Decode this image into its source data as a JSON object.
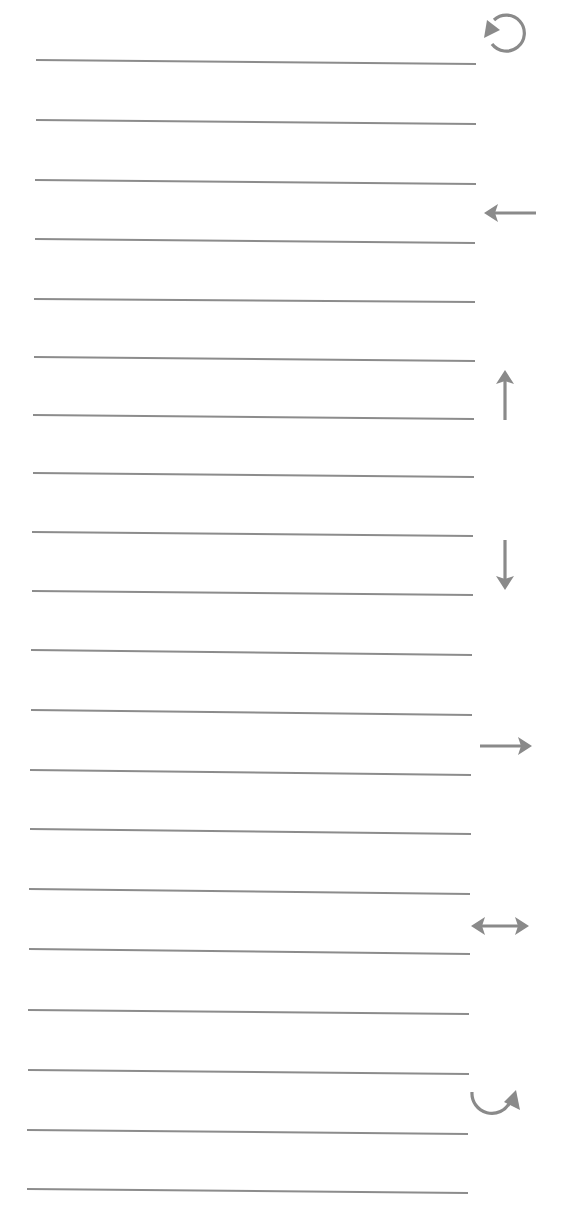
{
  "page": {
    "background": "#ffffff"
  },
  "style": {
    "line_color": "#8c8c8c",
    "icon_color": "#8a8a8a",
    "line_thickness": 2,
    "icon_stroke": 3.2
  },
  "lines": [
    {
      "x1": 36,
      "y1": 60,
      "x2": 476,
      "y2": 64
    },
    {
      "x1": 36,
      "y1": 120,
      "x2": 476,
      "y2": 124
    },
    {
      "x1": 35,
      "y1": 180,
      "x2": 476,
      "y2": 184
    },
    {
      "x1": 35,
      "y1": 239,
      "x2": 475,
      "y2": 243
    },
    {
      "x1": 34,
      "y1": 299,
      "x2": 475,
      "y2": 302
    },
    {
      "x1": 34,
      "y1": 357,
      "x2": 475,
      "y2": 361
    },
    {
      "x1": 33,
      "y1": 415,
      "x2": 474,
      "y2": 419
    },
    {
      "x1": 33,
      "y1": 473,
      "x2": 474,
      "y2": 477
    },
    {
      "x1": 32,
      "y1": 532,
      "x2": 473,
      "y2": 536
    },
    {
      "x1": 32,
      "y1": 591,
      "x2": 473,
      "y2": 595
    },
    {
      "x1": 31,
      "y1": 650,
      "x2": 472,
      "y2": 655
    },
    {
      "x1": 31,
      "y1": 710,
      "x2": 472,
      "y2": 715
    },
    {
      "x1": 30,
      "y1": 770,
      "x2": 471,
      "y2": 775
    },
    {
      "x1": 30,
      "y1": 829,
      "x2": 471,
      "y2": 834
    },
    {
      "x1": 29,
      "y1": 889,
      "x2": 470,
      "y2": 894
    },
    {
      "x1": 29,
      "y1": 949,
      "x2": 470,
      "y2": 954
    },
    {
      "x1": 28,
      "y1": 1010,
      "x2": 469,
      "y2": 1014
    },
    {
      "x1": 28,
      "y1": 1070,
      "x2": 469,
      "y2": 1074
    },
    {
      "x1": 27,
      "y1": 1130,
      "x2": 468,
      "y2": 1134
    },
    {
      "x1": 27,
      "y1": 1189,
      "x2": 468,
      "y2": 1193
    }
  ],
  "icons": [
    {
      "name": "rotate-counterclockwise-icon",
      "label": "Rotate counterclockwise",
      "x": 480,
      "y": 8,
      "w": 54,
      "h": 52
    },
    {
      "name": "arrow-left-icon",
      "label": "Arrow left",
      "x": 482,
      "y": 200,
      "w": 56,
      "h": 26
    },
    {
      "name": "arrow-up-icon",
      "label": "Arrow up",
      "x": 492,
      "y": 368,
      "w": 26,
      "h": 54
    },
    {
      "name": "arrow-down-icon",
      "label": "Arrow down",
      "x": 492,
      "y": 538,
      "w": 26,
      "h": 54
    },
    {
      "name": "arrow-right-icon",
      "label": "Arrow right",
      "x": 478,
      "y": 733,
      "w": 56,
      "h": 26
    },
    {
      "name": "arrow-left-right-icon",
      "label": "Arrow left-right",
      "x": 469,
      "y": 913,
      "w": 62,
      "h": 26
    },
    {
      "name": "rotate-clockwise-icon",
      "label": "Rotate clockwise",
      "x": 468,
      "y": 1088,
      "w": 58,
      "h": 40
    }
  ]
}
